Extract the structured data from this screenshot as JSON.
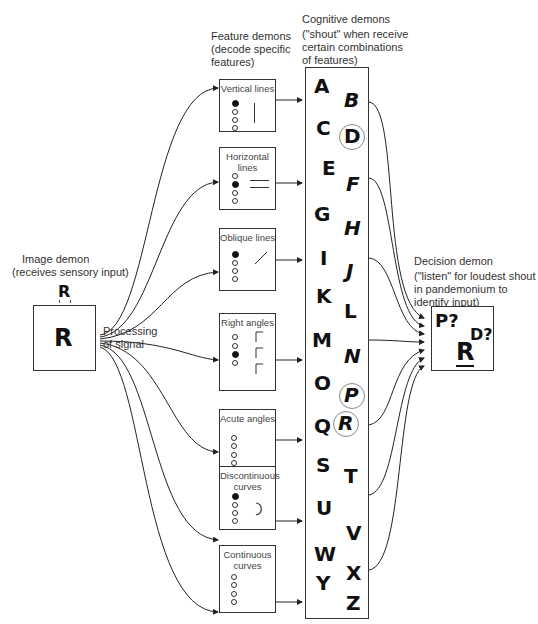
{
  "image_demon": {
    "title": "Image demon",
    "subtitle": "(receives sensory input)",
    "input_letter": "R",
    "image_letter": "R",
    "process_label_1": "Processing",
    "process_label_2": "of signal"
  },
  "feature_demons": {
    "title": "Feature demons",
    "subtitle_1": "(decode specific",
    "subtitle_2": "features)",
    "boxes": [
      {
        "label_1": "Vertical lines",
        "label_2": "",
        "active": [
          true,
          false,
          false,
          false
        ],
        "glyph": "vertical-line"
      },
      {
        "label_1": "Horizontal lines",
        "label_2": "",
        "active": [
          false,
          true,
          false,
          false
        ],
        "glyph": "horizontal-lines"
      },
      {
        "label_1": "Oblique lines",
        "label_2": "",
        "active": [
          true,
          false,
          false,
          false
        ],
        "glyph": "oblique-line"
      },
      {
        "label_1": "Right angles",
        "label_2": "",
        "active": [
          false,
          false,
          true,
          false
        ],
        "glyph": "right-angles"
      },
      {
        "label_1": "Acute angles",
        "label_2": "",
        "active": [
          false,
          false,
          false,
          false
        ],
        "glyph": "none"
      },
      {
        "label_1": "Discontinuous",
        "label_2": "curves",
        "active": [
          true,
          false,
          false,
          false
        ],
        "glyph": "curve"
      },
      {
        "label_1": "Continuous",
        "label_2": "curves",
        "active": [
          false,
          false,
          false,
          false
        ],
        "glyph": "none"
      }
    ]
  },
  "cognitive_demons": {
    "title": "Cognitive demons",
    "subtitle_1": "(\"shout\" when receive",
    "subtitle_2": "certain combinations",
    "subtitle_3": "of features)",
    "letters_left": [
      "A",
      "C",
      "E",
      "G",
      "I",
      "K",
      "M",
      "O",
      "Q",
      "S",
      "U",
      "W",
      "Y"
    ],
    "letters_right": [
      "B",
      "D",
      "F",
      "H",
      "J",
      "L",
      "N",
      "P",
      "R",
      "T",
      "V",
      "X",
      "Z"
    ],
    "circled": [
      "D",
      "P",
      "R"
    ]
  },
  "decision_demon": {
    "title": "Decision demon",
    "subtitle_1": "(\"listen\" for loudest shout",
    "subtitle_2": "in pandemonium to",
    "subtitle_3": "identify input)",
    "guess_1": "P?",
    "guess_2": "D?",
    "answer": "R"
  }
}
